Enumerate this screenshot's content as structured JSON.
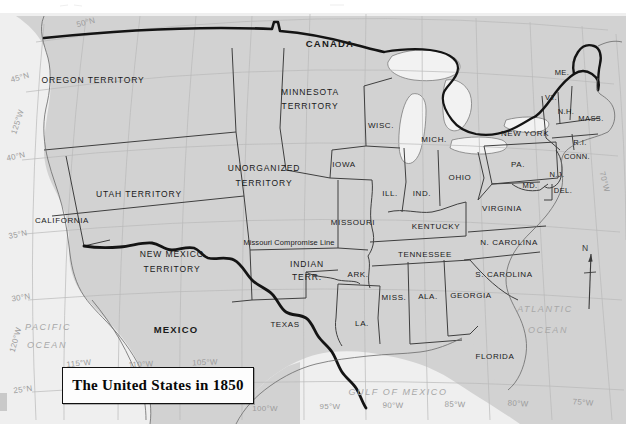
{
  "title": {
    "text": "The United States in 1850"
  },
  "colors": {
    "land": "#d2d2d2",
    "ocean": "#ededed",
    "paper": "#f4f4f4",
    "border_heavy": "#141414",
    "state_line": "#3c3c3c",
    "graticule": "#b5b5b5",
    "label_text": "#1a1a1a",
    "water_text": "#a8a8a8"
  },
  "compass": {
    "north_label": "N"
  },
  "countries": [
    {
      "name": "CANADA",
      "x": 330,
      "y": 44
    },
    {
      "name": "MEXICO",
      "x": 176,
      "y": 330
    }
  ],
  "territories": [
    {
      "name": "OREGON TERRITORY",
      "x": 93,
      "y": 80
    },
    {
      "name": "MINNESOTA",
      "x": 310,
      "y": 92
    },
    {
      "name": "TERRITORY",
      "x": 310,
      "y": 106
    },
    {
      "name": "UNORGANIZED",
      "x": 264,
      "y": 168
    },
    {
      "name": "TERRITORY",
      "x": 264,
      "y": 183
    },
    {
      "name": "UTAH  TERRITORY",
      "x": 139,
      "y": 194
    },
    {
      "name": "NEW MEXICO",
      "x": 172,
      "y": 254
    },
    {
      "name": "TERRITORY",
      "x": 172,
      "y": 269
    },
    {
      "name": "INDIAN",
      "x": 307,
      "y": 264
    },
    {
      "name": "TERR.",
      "x": 307,
      "y": 277
    }
  ],
  "states": [
    {
      "name": "CALIFORNIA",
      "x": 62,
      "y": 221,
      "size": "state"
    },
    {
      "name": "TEXAS",
      "x": 285,
      "y": 325,
      "size": "state"
    },
    {
      "name": "IOWA",
      "x": 344,
      "y": 165,
      "size": "state"
    },
    {
      "name": "WISC.",
      "x": 381,
      "y": 126,
      "size": "state"
    },
    {
      "name": "MICH.",
      "x": 434,
      "y": 140,
      "size": "state"
    },
    {
      "name": "ILL.",
      "x": 390,
      "y": 194,
      "size": "state"
    },
    {
      "name": "IND.",
      "x": 422,
      "y": 194,
      "size": "state"
    },
    {
      "name": "OHIO",
      "x": 460,
      "y": 178,
      "size": "state"
    },
    {
      "name": "MISSOURI",
      "x": 353,
      "y": 223,
      "size": "state"
    },
    {
      "name": "KENTUCKY",
      "x": 436,
      "y": 227,
      "size": "state"
    },
    {
      "name": "TENNESSEE",
      "x": 425,
      "y": 255,
      "size": "state"
    },
    {
      "name": "ARK.",
      "x": 358,
      "y": 275,
      "size": "state"
    },
    {
      "name": "MISS.",
      "x": 394,
      "y": 298,
      "size": "state"
    },
    {
      "name": "ALA.",
      "x": 428,
      "y": 297,
      "size": "state"
    },
    {
      "name": "GEORGIA",
      "x": 471,
      "y": 296,
      "size": "state"
    },
    {
      "name": "LA.",
      "x": 362,
      "y": 324,
      "size": "state"
    },
    {
      "name": "FLORIDA",
      "x": 495,
      "y": 357,
      "size": "state"
    },
    {
      "name": "N. CAROLINA",
      "x": 509,
      "y": 243,
      "size": "state"
    },
    {
      "name": "S. CAROLINA",
      "x": 504,
      "y": 275,
      "size": "state"
    },
    {
      "name": "VIRGINIA",
      "x": 502,
      "y": 209,
      "size": "state"
    },
    {
      "name": "NEW YORK",
      "x": 525,
      "y": 134,
      "size": "state"
    },
    {
      "name": "PA.",
      "x": 518,
      "y": 165,
      "size": "state"
    },
    {
      "name": "ME.",
      "x": 562,
      "y": 73,
      "size": "small"
    },
    {
      "name": "VT.",
      "x": 551,
      "y": 98,
      "size": "small"
    },
    {
      "name": "N.H.",
      "x": 566,
      "y": 112,
      "size": "small"
    },
    {
      "name": "MASS.",
      "x": 591,
      "y": 119,
      "size": "small"
    },
    {
      "name": "R.I.",
      "x": 580,
      "y": 143,
      "size": "small"
    },
    {
      "name": "CONN.",
      "x": 577,
      "y": 157,
      "size": "small"
    },
    {
      "name": "N.J.",
      "x": 557,
      "y": 175,
      "size": "small"
    },
    {
      "name": "MD.",
      "x": 530,
      "y": 186,
      "size": "small"
    },
    {
      "name": "DEL.",
      "x": 563,
      "y": 191,
      "size": "small"
    }
  ],
  "annotations": [
    {
      "name": "Missouri Compromise Line",
      "x": 289,
      "y": 243
    }
  ],
  "water_bodies": [
    {
      "name": "PACIFIC",
      "x": 48,
      "y": 327
    },
    {
      "name": "OCEAN",
      "x": 47,
      "y": 345
    },
    {
      "name": "ATLANTIC",
      "x": 545,
      "y": 309
    },
    {
      "name": "OCEAN",
      "x": 548,
      "y": 330
    },
    {
      "name": "GULF OF MEXICO",
      "x": 398,
      "y": 392
    }
  ],
  "graticule": {
    "latitudes": [
      {
        "label": "50°N",
        "x": 86,
        "y": 23,
        "rot": -14
      },
      {
        "label": "45°N",
        "x": 20,
        "y": 78,
        "rot": -16
      },
      {
        "label": "40°N",
        "x": 16,
        "y": 157,
        "rot": -13
      },
      {
        "label": "35°N",
        "x": 18,
        "y": 235,
        "rot": -11
      },
      {
        "label": "30°N",
        "x": 21,
        "y": 298,
        "rot": -9
      },
      {
        "label": "25°N",
        "x": 23,
        "y": 390,
        "rot": -8
      }
    ],
    "longitudes": [
      {
        "label": "125°W",
        "x": 18,
        "y": 122,
        "rot": -72
      },
      {
        "label": "120°W",
        "x": 16,
        "y": 340,
        "rot": -74
      },
      {
        "label": "115°W",
        "x": 79,
        "y": 364,
        "rot": -6
      },
      {
        "label": "110°W",
        "x": 141,
        "y": 365,
        "rot": -4
      },
      {
        "label": "105°W",
        "x": 205,
        "y": 363,
        "rot": -2
      },
      {
        "label": "100°W",
        "x": 265,
        "y": 409,
        "rot": 0
      },
      {
        "label": "95°W",
        "x": 330,
        "y": 407,
        "rot": 0
      },
      {
        "label": "90°W",
        "x": 393,
        "y": 406,
        "rot": 1
      },
      {
        "label": "85°W",
        "x": 455,
        "y": 405,
        "rot": 2
      },
      {
        "label": "80°W",
        "x": 518,
        "y": 404,
        "rot": 3
      },
      {
        "label": "75°W",
        "x": 583,
        "y": 403,
        "rot": 4
      },
      {
        "label": "70°W",
        "x": 604,
        "y": 182,
        "rot": 76
      }
    ]
  }
}
